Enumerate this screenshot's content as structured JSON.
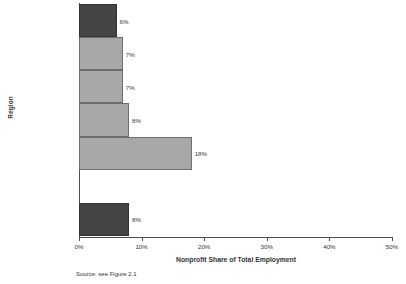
{
  "chart_data": {
    "type": "bar",
    "orientation": "horizontal",
    "title": "",
    "xlabel": "Nonprofit Share of Total Employment",
    "ylabel": "Region",
    "xlim": [
      0,
      50
    ],
    "xticks": [
      "0%",
      "10%",
      "20%",
      "30%",
      "40%",
      "50%"
    ],
    "xtick_values": [
      0,
      10,
      20,
      30,
      40,
      50
    ],
    "grid": false,
    "legend": null,
    "categories": [
      "Washington suburbs",
      "Baltimore suburbs",
      "Eastern Shore",
      "Western Maryland",
      "Baltimore City",
      "",
      "TOTAL"
    ],
    "values": [
      6,
      7,
      7,
      8,
      18,
      null,
      8
    ],
    "data_labels": [
      "6%",
      "7%",
      "7%",
      "8%",
      "18%",
      "",
      "8%"
    ],
    "bars": [
      {
        "label": "Washington suburbs",
        "value": 6,
        "data_label": "6%",
        "style": "dark",
        "emphasis": false
      },
      {
        "label": "Baltimore suburbs",
        "value": 7,
        "data_label": "7%",
        "style": "light",
        "emphasis": false
      },
      {
        "label": "Eastern Shore",
        "value": 7,
        "data_label": "7%",
        "style": "light",
        "emphasis": false
      },
      {
        "label": "Western Maryland",
        "value": 8,
        "data_label": "8%",
        "style": "light",
        "emphasis": false
      },
      {
        "label": "Baltimore City",
        "value": 18,
        "data_label": "18%",
        "style": "light",
        "emphasis": false
      },
      {
        "label": "",
        "value": 0,
        "data_label": "",
        "style": "none",
        "emphasis": false
      },
      {
        "label": "TOTAL",
        "value": 8,
        "data_label": "8%",
        "style": "dark",
        "emphasis": true
      }
    ],
    "colors": {
      "bar_light": "#a8a8a8",
      "bar_dark": "#444444",
      "bar_edge": "#6e6e6e",
      "axis": "#4d4d4d",
      "text": "#333333",
      "background": "#ffffff"
    }
  },
  "footnote": "Source: see Figure 2.1"
}
